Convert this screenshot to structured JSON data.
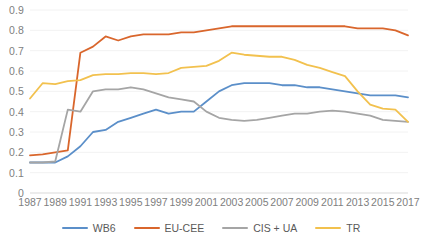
{
  "chart_data": {
    "type": "line",
    "title": "",
    "xlabel": "",
    "ylabel": "",
    "xlim": [
      1987,
      2017
    ],
    "ylim": [
      0,
      0.9
    ],
    "grid": true,
    "legend_position": "bottom",
    "y_ticks": [
      "0.9",
      "0.8",
      "0.7",
      "0.6",
      "0.5",
      "0.4",
      "0.3",
      "0.2",
      "0.1",
      "0"
    ],
    "y_tick_values": [
      0.9,
      0.8,
      0.7,
      0.6,
      0.5,
      0.4,
      0.3,
      0.2,
      0.1,
      0
    ],
    "x_tick_labels": [
      "1987",
      "1989",
      "1991",
      "1993",
      "1995",
      "1997",
      "1999",
      "2001",
      "2003",
      "2005",
      "2007",
      "2009",
      "2011",
      "2013",
      "2015",
      "2017"
    ],
    "x": [
      1987,
      1988,
      1989,
      1990,
      1991,
      1992,
      1993,
      1994,
      1995,
      1996,
      1997,
      1998,
      1999,
      2000,
      2001,
      2002,
      2003,
      2004,
      2005,
      2006,
      2007,
      2008,
      2009,
      2010,
      2011,
      2012,
      2013,
      2014,
      2015,
      2016,
      2017
    ],
    "series": [
      {
        "name": "WB6",
        "color": "#5B8FC9",
        "values": [
          0.15,
          0.15,
          0.15,
          0.18,
          0.23,
          0.3,
          0.31,
          0.35,
          0.37,
          0.39,
          0.41,
          0.39,
          0.4,
          0.4,
          0.45,
          0.5,
          0.53,
          0.54,
          0.54,
          0.54,
          0.53,
          0.53,
          0.52,
          0.52,
          0.51,
          0.5,
          0.49,
          0.48,
          0.48,
          0.48,
          0.47
        ]
      },
      {
        "name": "EU-CEE",
        "color": "#D9662C",
        "values": [
          0.185,
          0.19,
          0.2,
          0.21,
          0.69,
          0.72,
          0.77,
          0.75,
          0.77,
          0.78,
          0.78,
          0.78,
          0.79,
          0.79,
          0.8,
          0.81,
          0.82,
          0.82,
          0.82,
          0.82,
          0.82,
          0.82,
          0.82,
          0.82,
          0.82,
          0.82,
          0.81,
          0.81,
          0.81,
          0.8,
          0.775
        ]
      },
      {
        "name": "CIS + UA",
        "color": "#A5A5A5",
        "values": [
          0.15,
          0.15,
          0.155,
          0.41,
          0.4,
          0.5,
          0.51,
          0.51,
          0.52,
          0.51,
          0.49,
          0.47,
          0.46,
          0.45,
          0.4,
          0.37,
          0.36,
          0.355,
          0.36,
          0.37,
          0.38,
          0.39,
          0.39,
          0.4,
          0.405,
          0.4,
          0.39,
          0.38,
          0.36,
          0.355,
          0.35
        ]
      },
      {
        "name": "TR",
        "color": "#F2C14E",
        "values": [
          0.465,
          0.54,
          0.535,
          0.55,
          0.555,
          0.58,
          0.585,
          0.585,
          0.59,
          0.59,
          0.585,
          0.59,
          0.615,
          0.62,
          0.625,
          0.65,
          0.69,
          0.68,
          0.675,
          0.67,
          0.67,
          0.655,
          0.63,
          0.615,
          0.595,
          0.575,
          0.5,
          0.435,
          0.415,
          0.41,
          0.35
        ]
      }
    ]
  },
  "legend": {
    "items": [
      {
        "label": "WB6",
        "color": "#5B8FC9"
      },
      {
        "label": "EU-CEE",
        "color": "#D9662C"
      },
      {
        "label": "CIS + UA",
        "color": "#A5A5A5"
      },
      {
        "label": "TR",
        "color": "#F2C14E"
      }
    ]
  }
}
